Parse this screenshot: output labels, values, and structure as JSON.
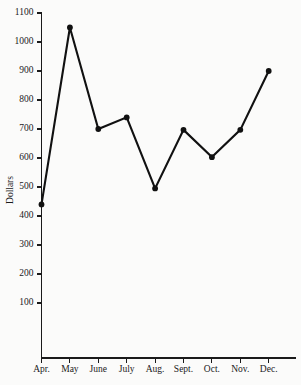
{
  "chart_data": {
    "type": "line",
    "title": "",
    "subtitle": "",
    "xlabel": "",
    "ylabel": "Dollars",
    "categories": [
      "Apr.",
      "May",
      "June",
      "July",
      "Aug.",
      "Sept.",
      "Oct.",
      "Nov.",
      "Dec."
    ],
    "values": [
      440,
      1050,
      700,
      740,
      495,
      697,
      603,
      697,
      900
    ],
    "series": [
      {
        "name": "Dollars",
        "values": [
          440,
          1050,
          700,
          740,
          495,
          697,
          603,
          697,
          900
        ]
      }
    ],
    "ylim": [
      0,
      1100
    ],
    "yticks": [
      100,
      200,
      300,
      400,
      500,
      600,
      700,
      800,
      900,
      1000,
      1100
    ],
    "ytick_labels": [
      "100",
      "200",
      "300",
      "400",
      "500",
      "600",
      "700",
      "800",
      "900",
      "1000",
      "1100"
    ],
    "xtick_labels": [
      "Apr.",
      "May",
      "June",
      "July",
      "Aug.",
      "Sept.",
      "Oct.",
      "Nov.",
      "Dec."
    ],
    "grid": false,
    "legend": false,
    "legend_position": "none",
    "marker": "filled-circle",
    "line_color": "#111111",
    "marker_color": "#111111",
    "axis_color": "#1a1a1a",
    "background_color": "#fbfbfa",
    "annotations": []
  },
  "figure": {
    "y_axis_title": "Dollars"
  }
}
